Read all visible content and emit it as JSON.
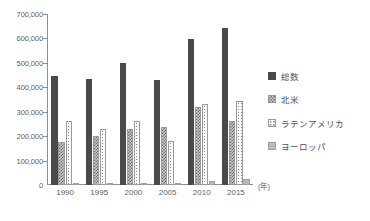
{
  "chart_data": {
    "type": "bar",
    "title": "",
    "xlabel": "(年)",
    "ylabel": "",
    "categories": [
      "1990",
      "1995",
      "2000",
      "2005",
      "2010",
      "2015"
    ],
    "ylim": [
      0,
      700000
    ],
    "ytick_step": 100000,
    "ytick_labels": [
      "0",
      "100,000",
      "200,000",
      "300,000",
      "400,000",
      "500,000",
      "600,000",
      "700,000"
    ],
    "ytick_values": [
      0,
      100000,
      200000,
      300000,
      400000,
      500000,
      600000,
      700000
    ],
    "grid": false,
    "legend_position": "right",
    "series": [
      {
        "name": "総数",
        "values": [
          445000,
          432000,
          498000,
          430000,
          598000,
          642000
        ]
      },
      {
        "name": "北米",
        "values": [
          177000,
          200000,
          230000,
          237000,
          318000,
          263000
        ]
      },
      {
        "name": "ラテンアメリカ",
        "values": [
          262000,
          230000,
          262000,
          182000,
          332000,
          345000
        ]
      },
      {
        "name": "ヨーロッパ",
        "values": [
          5000,
          6000,
          8000,
          10000,
          18000,
          25000
        ]
      }
    ]
  },
  "axis": {
    "x_unit_label": "(年)"
  }
}
